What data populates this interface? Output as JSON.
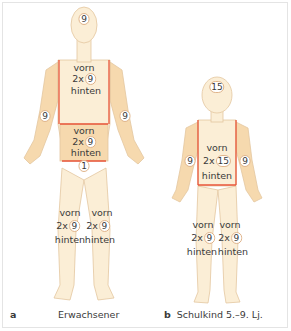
{
  "colors": {
    "skin_light": "#fbeed6",
    "skin_shaded": "#f6d9ae",
    "skin_outline": "#e3c6a0",
    "region_line": "#e8553a",
    "text": "#3a3a3a",
    "frame": "#e4e4e4"
  },
  "adult": {
    "letter": "a",
    "caption": "Erwachsener",
    "head": "9",
    "chest": {
      "top": "vorn",
      "mult": "2x",
      "value": "9",
      "bottom": "hinten"
    },
    "abdomen": {
      "top": "vorn",
      "mult": "2x",
      "value": "9",
      "bottom": "hinten"
    },
    "arm_left": "9",
    "arm_right": "9",
    "genital": "1",
    "leg_left": {
      "top": "vorn",
      "mult": "2x",
      "value": "9",
      "bottom": "hinten"
    },
    "leg_right": {
      "top": "vorn",
      "mult": "2x",
      "value": "9",
      "bottom": "hinten"
    }
  },
  "child": {
    "letter": "b",
    "caption": "Schulkind 5.–9. Lj.",
    "head": "15",
    "trunk": {
      "top": "vorn",
      "mult": "2x",
      "value": "15",
      "bottom": "hinten"
    },
    "arm_left": "9",
    "arm_right": "9",
    "leg_left": {
      "top": "vorn",
      "mult": "2x",
      "value": "9",
      "bottom": "hinten"
    },
    "leg_right": {
      "top": "vorn",
      "mult": "2x",
      "value": "9",
      "bottom": "hinten"
    }
  }
}
